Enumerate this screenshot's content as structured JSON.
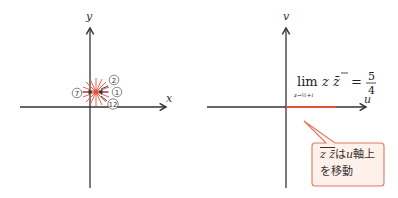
{
  "left_plane": {
    "x_axis_label": "x",
    "y_axis_label": "y",
    "markers": [
      {
        "label": "2"
      },
      {
        "label": "1"
      },
      {
        "label": "12"
      },
      {
        "label": "7"
      }
    ],
    "burst_color": "#e8503a"
  },
  "right_plane": {
    "u_axis_label": "u",
    "v_axis_label": "v",
    "limit_expression": {
      "operator": "lim",
      "subscript": "z→½+i",
      "body": "z z̄",
      "equals": "=",
      "numerator": "5",
      "denominator": "4"
    },
    "segment_color": "#e8503a",
    "callout": {
      "line1_math": "z z̄",
      "line1_text": "は",
      "line1_var": "u",
      "line1_suffix": "軸上",
      "line2": "を移動",
      "border_color": "#e07a62",
      "fill_color": "#fdf1ea"
    }
  }
}
